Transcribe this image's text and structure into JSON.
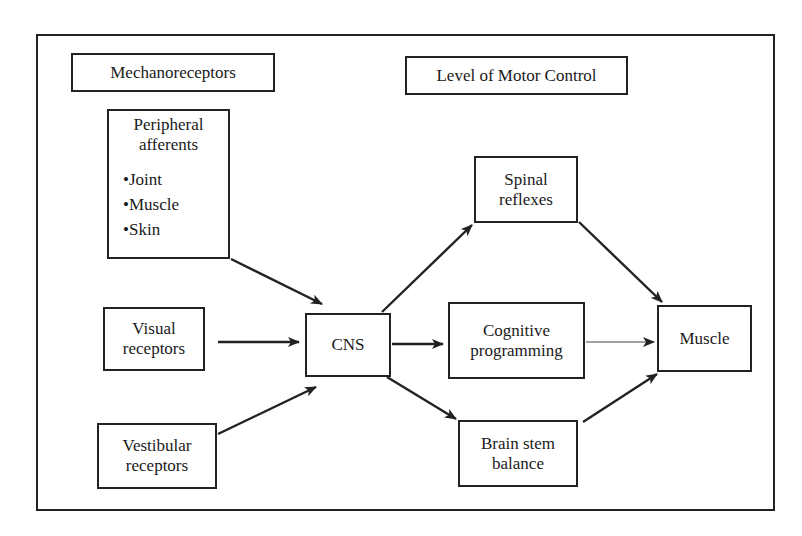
{
  "diagram": {
    "headers": {
      "left": "Mechanoreceptors",
      "right": "Level of Motor Control"
    },
    "nodes": {
      "peripheral": {
        "title_lines": [
          "Peripheral",
          "afferents"
        ],
        "bullets": [
          "•Joint",
          "•Muscle",
          "•Skin"
        ]
      },
      "visual": {
        "lines": [
          "Visual",
          "receptors"
        ]
      },
      "vestibular": {
        "lines": [
          "Vestibular",
          "receptors"
        ]
      },
      "cns": {
        "lines": [
          "CNS"
        ]
      },
      "spinal": {
        "lines": [
          "Spinal",
          "reflexes"
        ]
      },
      "cognitive": {
        "lines": [
          "Cognitive",
          "programming"
        ]
      },
      "brainstem": {
        "lines": [
          "Brain stem",
          "balance"
        ]
      },
      "muscle": {
        "lines": [
          "Muscle"
        ]
      }
    },
    "edges": [
      {
        "from": "Peripheral afferents",
        "to": "CNS"
      },
      {
        "from": "Visual receptors",
        "to": "CNS"
      },
      {
        "from": "Vestibular receptors",
        "to": "CNS"
      },
      {
        "from": "CNS",
        "to": "Spinal reflexes"
      },
      {
        "from": "CNS",
        "to": "Cognitive programming"
      },
      {
        "from": "CNS",
        "to": "Brain stem balance"
      },
      {
        "from": "Spinal reflexes",
        "to": "Muscle"
      },
      {
        "from": "Cognitive programming",
        "to": "Muscle",
        "style": "thin"
      },
      {
        "from": "Brain stem balance",
        "to": "Muscle"
      }
    ],
    "colors": {
      "stroke": "#222222",
      "background": "#ffffff"
    }
  }
}
